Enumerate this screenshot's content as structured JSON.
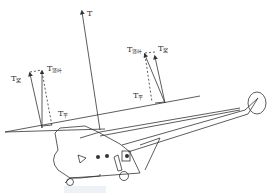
{
  "diagram": {
    "type": "helicopter-rotor-thrust-vectors",
    "labels": {
      "total_thrust": {
        "main": "T",
        "sub": ""
      },
      "left_blade_thrust": {
        "main": "T",
        "sub": "桨"
      },
      "left_vertical": {
        "main": "T",
        "sub": "竖叶"
      },
      "left_horizontal": {
        "main": "T",
        "sub": "平"
      },
      "right_vertical": {
        "main": "T",
        "sub": "竖叶"
      },
      "right_blade_thrust": {
        "main": "T",
        "sub": "桨"
      },
      "right_horizontal": {
        "main": "T",
        "sub": "平"
      }
    },
    "colors": {
      "line": "#333333",
      "background": "#ffffff"
    }
  }
}
